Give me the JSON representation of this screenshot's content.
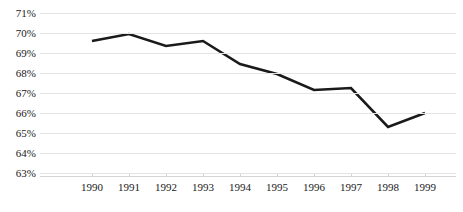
{
  "chart_data": {
    "type": "line",
    "title": "",
    "subtitle": "",
    "xlabel": "",
    "ylabel": "",
    "categories": [
      "1990",
      "1991",
      "1992",
      "1993",
      "1994",
      "1995",
      "1996",
      "1997",
      "1998",
      "1999"
    ],
    "x": [
      1990,
      1991,
      1992,
      1993,
      1994,
      1995,
      1996,
      1997,
      1998,
      1999
    ],
    "values": [
      69.6,
      69.95,
      69.35,
      69.6,
      68.45,
      67.95,
      67.15,
      67.25,
      65.3,
      66.0
    ],
    "series": [
      {
        "name": "",
        "values": [
          69.6,
          69.95,
          69.35,
          69.6,
          68.45,
          67.95,
          67.15,
          67.25,
          65.3,
          66.0
        ]
      }
    ],
    "ylim": [
      63,
      71
    ],
    "ytick_values": [
      71,
      70,
      69,
      68,
      67,
      66,
      65,
      64,
      63
    ],
    "ytick_labels": [
      "71%",
      "70%",
      "69%",
      "68%",
      "67%",
      "66%",
      "65%",
      "64%",
      "63%"
    ],
    "xtick_labels": [
      "1990",
      "1991",
      "1992",
      "1993",
      "1994",
      "1995",
      "1996",
      "1997",
      "1998",
      "1999"
    ],
    "grid": true,
    "grid_axis": "y",
    "legend": false,
    "legend_position": "none",
    "annotations": [],
    "colors": {
      "background": "#ffffff",
      "line": "#1a1a1a",
      "gridline": "#e4e4e4",
      "axis": "#d5d5d5",
      "text": "#1a1a1a"
    },
    "line_width": 2.6
  }
}
